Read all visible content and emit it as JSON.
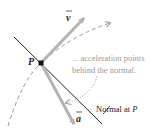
{
  "diagram": {
    "point_label": "P",
    "velocity_label": "v",
    "acceleration_label": "a",
    "annotation_line1": "... acceleration points",
    "annotation_line2": "behind the normal.",
    "normal_label_prefix": "Normal at ",
    "normal_label_point": "P",
    "colors": {
      "vector": "#b3b3b3",
      "curve": "#9a9a9a",
      "line": "#222222",
      "annotation": "#9a9a9a",
      "text": "#222222"
    }
  }
}
